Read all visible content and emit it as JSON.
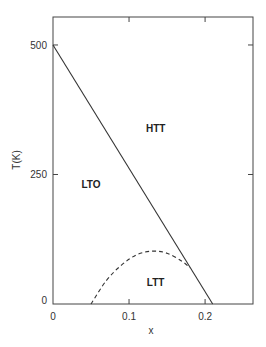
{
  "chart_data": {
    "type": "line",
    "title": "",
    "xlabel": "x",
    "ylabel": "T(K)",
    "xlim": [
      0,
      0.263
    ],
    "ylim": [
      0,
      554
    ],
    "grid": false,
    "x_ticks": [
      0,
      0.1,
      0.2
    ],
    "x_tick_labels": [
      "0",
      "0.1",
      "0.2"
    ],
    "y_ticks": [
      0,
      250,
      500
    ],
    "y_tick_labels": [
      "0",
      "250",
      "500"
    ],
    "series": [
      {
        "name": "HTT-LTO boundary",
        "style": "solid",
        "x": [
          0,
          0.21
        ],
        "y": [
          500,
          0
        ]
      },
      {
        "name": "LTO-LTT boundary",
        "style": "dashed",
        "x": [
          0.05,
          0.07,
          0.09,
          0.11,
          0.13,
          0.15,
          0.17,
          0.18
        ],
        "y": [
          0,
          45,
          75,
          95,
          102,
          98,
          82,
          70
        ]
      }
    ],
    "annotations": [
      {
        "text": "HTT",
        "x": 0.135,
        "y": 340
      },
      {
        "text": "LTO",
        "x": 0.05,
        "y": 232
      },
      {
        "text": "LTT",
        "x": 0.135,
        "y": 42
      }
    ],
    "legend": null
  }
}
